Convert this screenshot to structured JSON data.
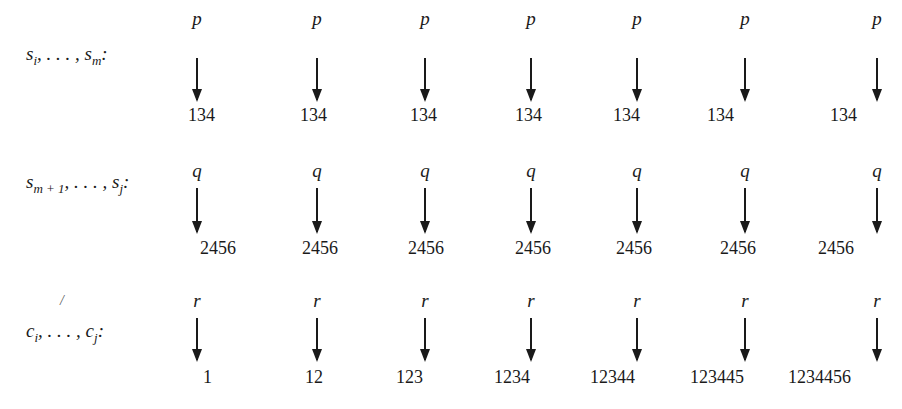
{
  "rows": [
    {
      "label_html": "s<sub>i</sub>, . . . , s<sub>m</sub>:",
      "symbol": "p",
      "values": [
        "134",
        "134",
        "134",
        "134",
        "134",
        "134",
        "134"
      ]
    },
    {
      "label_html": "s<sub>m + 1</sub>, . . . , s<sub>j</sub>:",
      "symbol": "q",
      "values": [
        "2456",
        "2456",
        "2456",
        "2456",
        "2456",
        "2456",
        "2456"
      ]
    },
    {
      "label_html": "c<sub>i</sub>, . . . , c<sub>j</sub>:",
      "symbol": "r",
      "values": [
        "1",
        "12",
        "123",
        "1234",
        "12344",
        "123445",
        "1234456"
      ]
    }
  ],
  "stray_mark": "/"
}
